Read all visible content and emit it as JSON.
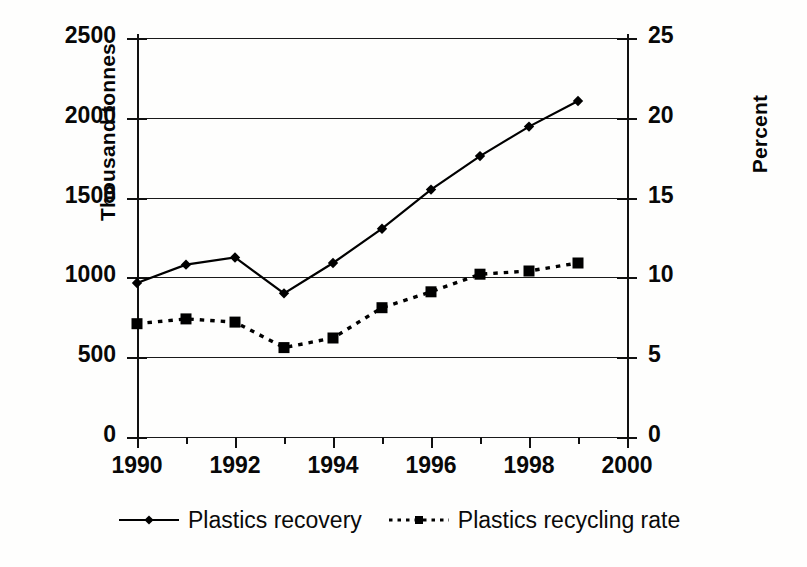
{
  "chart_data": {
    "type": "line",
    "title": "",
    "xlabel": "",
    "ylabel": "Thousand tonnes",
    "y2label": "Percent",
    "x": [
      1990,
      1991,
      1992,
      1993,
      1994,
      1995,
      1996,
      1997,
      1998,
      1999
    ],
    "xlim": [
      1990,
      2000
    ],
    "xticklabels": [
      "1990",
      "1992",
      "1994",
      "1996",
      "1998",
      "2000"
    ],
    "xticks": [
      1990,
      1992,
      1994,
      1996,
      1998,
      2000
    ],
    "xminorticks": [
      1991,
      1993,
      1995,
      1997,
      1999
    ],
    "ylim": [
      0,
      2500
    ],
    "yticklabels": [
      "0",
      "500",
      "1000",
      "1500",
      "2000",
      "2500"
    ],
    "yticks": [
      0,
      500,
      1000,
      1500,
      2000,
      2500
    ],
    "y2lim": [
      0,
      25
    ],
    "y2ticklabels": [
      "0",
      "5",
      "10",
      "15",
      "20",
      "25"
    ],
    "y2ticks": [
      0,
      5,
      10,
      15,
      20,
      25
    ],
    "grid": true,
    "legend_position": "below",
    "series": [
      {
        "name": "Plastics recovery",
        "axis": "left",
        "units": "thousand tonnes",
        "linestyle": "solid",
        "marker": "diamond",
        "color": "#000000",
        "values": [
          965,
          1080,
          1125,
          900,
          1090,
          1305,
          1550,
          1760,
          1945,
          2105
        ]
      },
      {
        "name": "Plastics recycling rate",
        "axis": "right",
        "units": "percent",
        "linestyle": "dotted",
        "marker": "square",
        "color": "#000000",
        "values": [
          7.1,
          7.4,
          7.2,
          5.6,
          6.2,
          8.1,
          9.1,
          10.2,
          10.4,
          10.9
        ]
      }
    ]
  },
  "legend": {
    "items": [
      {
        "label": "Plastics recovery",
        "glyph": "solid-line-diamond-marker"
      },
      {
        "label": "Plastics recycling rate",
        "glyph": "dotted-line-square-marker"
      }
    ]
  }
}
